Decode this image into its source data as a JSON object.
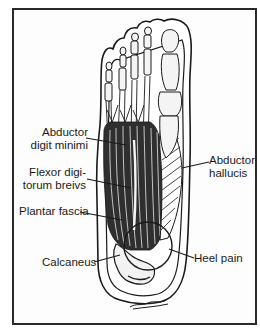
{
  "figure": {
    "labels": {
      "abductor_digiti_minimi": {
        "line1": "Abductor",
        "line2": "digit minimi"
      },
      "flexor_digitorum_brevis": {
        "line1": "Flexor digi-",
        "line2": "torum breivs"
      },
      "plantar_fascia": {
        "text": "Plantar fascia"
      },
      "calcaneus": {
        "text": "Calcaneus"
      },
      "heel_pain": {
        "text": "Heel pain"
      },
      "abductor_hallucis": {
        "line1": "Abductor",
        "line2": "hallucis"
      }
    },
    "signature": "K.R.Green",
    "colors": {
      "ink": "#1a1a1a",
      "frame": "#2a2a2a",
      "background": "#ffffff",
      "bone_fill": "#f2f2f2",
      "muscle_fill": "#3a3a3a"
    }
  }
}
